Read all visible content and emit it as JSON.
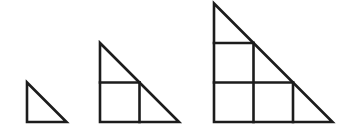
{
  "diagram": {
    "line_color": "#1c1c1c",
    "line_width": 2.6,
    "background": "#ffffff",
    "unit": 39.5,
    "baseline_y": 122,
    "figures": [
      {
        "name": "stage-1",
        "size": 1,
        "left_x": 27,
        "cells_squares": 0,
        "cells_triangles": 1
      },
      {
        "name": "stage-2",
        "size": 2,
        "left_x": 100,
        "cells_squares": 1,
        "cells_triangles": 2
      },
      {
        "name": "stage-3",
        "size": 3,
        "left_x": 214,
        "cells_squares": 3,
        "cells_triangles": 3
      }
    ]
  }
}
